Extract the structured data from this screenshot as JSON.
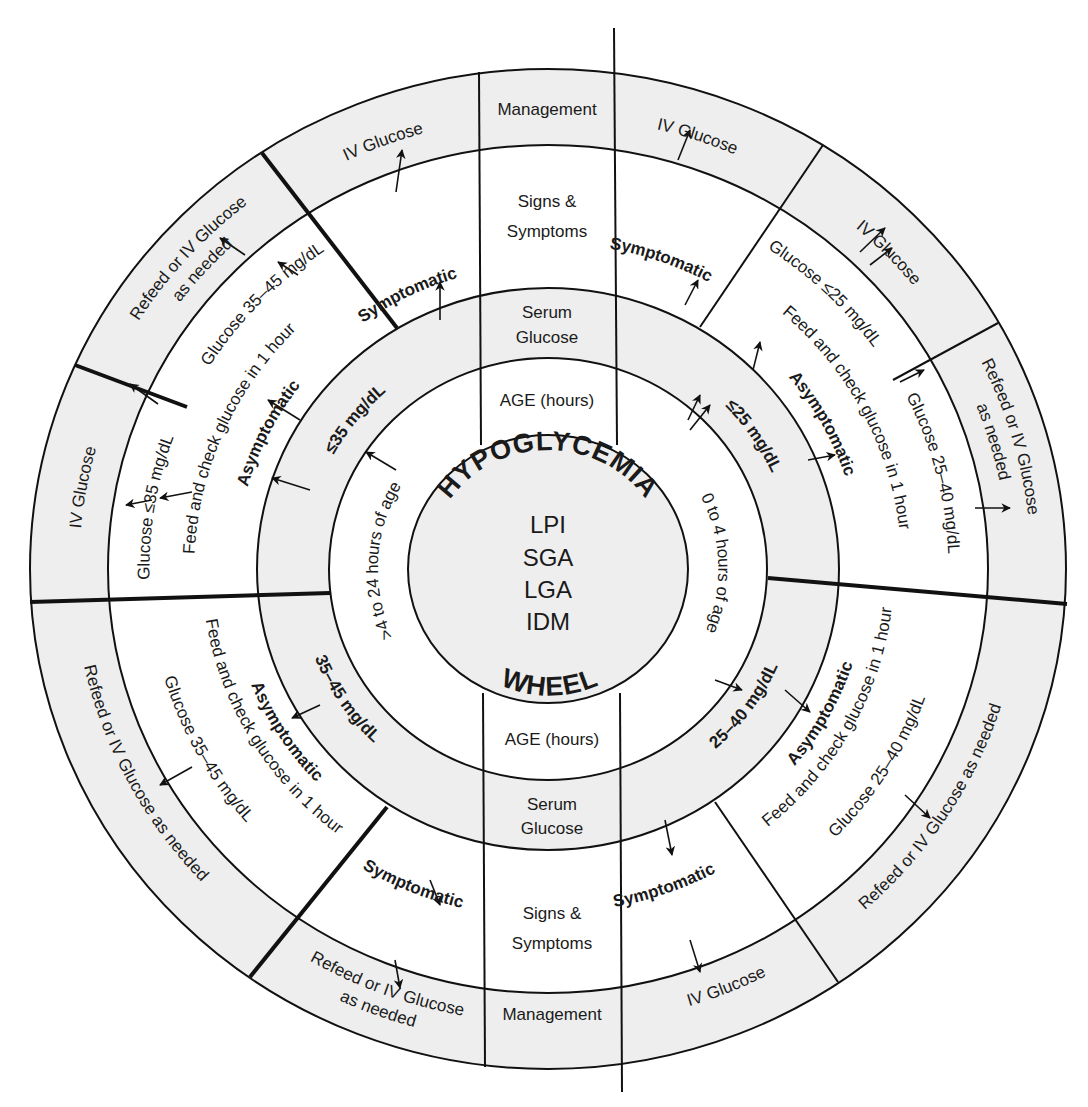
{
  "center": {
    "title_top": "HYPOGLYCEMIA",
    "title_bottom": "WHEEL",
    "conditions": [
      "LPI",
      "SGA",
      "LGA",
      "IDM"
    ]
  },
  "axis_labels": {
    "top": {
      "age": "AGE (hours)",
      "serum": [
        "Serum",
        "Glucose"
      ],
      "signs": [
        "Signs &",
        "Symptoms"
      ],
      "management": "Management"
    },
    "bottom": {
      "age": "AGE (hours)",
      "serum": [
        "Serum",
        "Glucose"
      ],
      "signs": [
        "Signs &",
        "Symptoms"
      ],
      "management": "Management"
    }
  },
  "colors": {
    "band_fill": "#eeeeee",
    "line": "#111111",
    "leq_symbol": "#8a8a8a"
  },
  "arc_labels": [
    {
      "id": "age-0-4",
      "text": "0 to 4 hours of age",
      "r": 168,
      "a": 88,
      "dir": "cw",
      "cls": "n"
    },
    {
      "id": "age-4-24",
      "text": ">4 to 24 hours of age",
      "r": 168,
      "a": 273,
      "dir": "cw",
      "cls": "n"
    },
    {
      "id": "serum-le25",
      "text": "≤25 mg/dL",
      "r": 240,
      "a": 57,
      "dir": "cw",
      "cls": "b"
    },
    {
      "id": "serum-25-40",
      "text": "25–40 mg/dL",
      "r": 238,
      "a": 125,
      "dir": "ccw",
      "cls": "b"
    },
    {
      "id": "serum-le35",
      "text": "≤35 mg/dL",
      "r": 240,
      "a": 308,
      "dir": "cw",
      "cls": "b"
    },
    {
      "id": "serum-35-45",
      "text": "35–45 mg/dL",
      "r": 238,
      "a": 237,
      "dir": "ccw",
      "cls": "b"
    },
    {
      "id": "sym-top-left",
      "text": "Symptomatic",
      "r": 308,
      "a": 333,
      "dir": "cw",
      "cls": "b"
    },
    {
      "id": "sym-top-right",
      "text": "Symptomatic",
      "r": 330,
      "a": 20,
      "dir": "cw",
      "cls": "b"
    },
    {
      "id": "asym-right-top",
      "text": "Asymptomatic",
      "r": 305,
      "a": 62,
      "dir": "cw",
      "cls": "b"
    },
    {
      "id": "asym-right-bottom",
      "text": "Asymptomatic",
      "r": 305,
      "a": 118,
      "dir": "ccw",
      "cls": "b"
    },
    {
      "id": "sym-bottom-right",
      "text": "Symptomatic",
      "r": 340,
      "a": 160,
      "dir": "ccw",
      "cls": "b"
    },
    {
      "id": "sym-bottom-left",
      "text": "Symptomatic",
      "r": 345,
      "a": 203,
      "dir": "ccw",
      "cls": "b"
    },
    {
      "id": "asym-bottom-left",
      "text": "Asymptomatic",
      "r": 305,
      "a": 238,
      "dir": "ccw",
      "cls": "b"
    },
    {
      "id": "asym-left",
      "text": "Asymptomatic",
      "r": 305,
      "a": 296,
      "dir": "cw",
      "cls": "b"
    },
    {
      "id": "feed-left",
      "text": "Feed and check glucose in 1 hour",
      "r": 345,
      "a": 293,
      "dir": "cw",
      "cls": "n"
    },
    {
      "id": "glucose-le35",
      "text": "Glucose ≤35 mg/dL",
      "r": 388,
      "a": 279,
      "dir": "cw",
      "cls": "n"
    },
    {
      "id": "glucose-35-45-top",
      "text": "Glucose 35–45 mg/dL",
      "r": 388,
      "a": 313,
      "dir": "cw",
      "cls": "n"
    },
    {
      "id": "glucose-le25",
      "text": "Glucose ≤25 mg/dL",
      "r": 388,
      "a": 45,
      "dir": "cw",
      "cls": "n"
    },
    {
      "id": "feed-right-top",
      "text": "Feed and check glucose in 1 hour",
      "r": 345,
      "a": 63,
      "dir": "cw",
      "cls": "n"
    },
    {
      "id": "glucose-25-40-right",
      "text": "Glucose 25–40 mg/dL",
      "r": 390,
      "a": 76,
      "dir": "cw",
      "cls": "n"
    },
    {
      "id": "feed-right-bottom",
      "text": "Feed and check glucose in 1 hour",
      "r": 330,
      "a": 118,
      "dir": "ccw",
      "cls": "n"
    },
    {
      "id": "glucose-25-40-bottom",
      "text": "Glucose 25–40 mg/dL",
      "r": 382,
      "a": 121,
      "dir": "ccw",
      "cls": "n"
    },
    {
      "id": "feed-left-bottom",
      "text": "Feed and check glucose in 1 hour",
      "r": 330,
      "a": 240,
      "dir": "ccw",
      "cls": "n"
    },
    {
      "id": "glucose-35-45-bottom",
      "text": "Glucose 35–45 mg/dL",
      "r": 382,
      "a": 242,
      "dir": "ccw",
      "cls": "n"
    },
    {
      "id": "iv-top-left",
      "text": "IV Glucose",
      "r": 456,
      "a": 339,
      "dir": "cw",
      "cls": "n"
    },
    {
      "id": "iv-top-right",
      "text": "IV Glucose",
      "r": 456,
      "a": 19,
      "dir": "cw",
      "cls": "n"
    },
    {
      "id": "iv-right-upper",
      "text": "IV Glucose",
      "r": 456,
      "a": 47,
      "dir": "cw",
      "cls": "n"
    },
    {
      "id": "refeed-right-1",
      "text": "Refeed or IV Glucose",
      "r": 470,
      "a": 74,
      "dir": "cw",
      "cls": "n"
    },
    {
      "id": "refeed-right-2",
      "text": "as needed",
      "r": 448,
      "a": 74,
      "dir": "cw",
      "cls": "n"
    },
    {
      "id": "refeed-bottom-right",
      "text": "Refeed or IV Glucose as needed",
      "r": 454,
      "a": 122,
      "dir": "ccw",
      "cls": "n"
    },
    {
      "id": "iv-bottom-right",
      "text": "IV Glucose",
      "r": 454,
      "a": 157,
      "dir": "ccw",
      "cls": "n"
    },
    {
      "id": "refeed-bottom-1",
      "text": "Refeed or IV Glucose",
      "r": 450,
      "a": 201,
      "dir": "ccw",
      "cls": "n"
    },
    {
      "id": "refeed-bottom-2",
      "text": "as needed",
      "r": 472,
      "a": 201,
      "dir": "ccw",
      "cls": "n"
    },
    {
      "id": "refeed-bottom-left",
      "text": "Refeed or IV Glucose as needed",
      "r": 454,
      "a": 243,
      "dir": "ccw",
      "cls": "n"
    },
    {
      "id": "iv-left",
      "text": "IV Glucose",
      "r": 456,
      "a": 280,
      "dir": "cw",
      "cls": "n"
    },
    {
      "id": "refeed-top-left-1",
      "text": "Refeed or IV Glucose",
      "r": 470,
      "a": 311,
      "dir": "cw",
      "cls": "n"
    },
    {
      "id": "refeed-top-left-2",
      "text": "as needed",
      "r": 448,
      "a": 311,
      "dir": "cw",
      "cls": "n"
    }
  ],
  "arrows": [
    [
      440,
      320,
      440,
      282
    ],
    [
      396,
      192,
      402,
      150
    ],
    [
      300,
      420,
      268,
      400
    ],
    [
      310,
      490,
      272,
      478
    ],
    [
      396,
      470,
      366,
      452
    ],
    [
      152,
      500,
      126,
      505
    ],
    [
      192,
      492,
      160,
      498
    ],
    [
      245,
      255,
      220,
      238
    ],
    [
      298,
      275,
      278,
      262
    ],
    [
      158,
      404,
      130,
      384
    ],
    [
      430,
      880,
      440,
      905
    ],
    [
      395,
      960,
      400,
      988
    ],
    [
      320,
      705,
      292,
      718
    ],
    [
      192,
      767,
      160,
      785
    ],
    [
      685,
      305,
      698,
      280
    ],
    [
      688,
      420,
      700,
      395
    ],
    [
      753,
      370,
      760,
      342
    ],
    [
      690,
      430,
      710,
      405
    ],
    [
      678,
      160,
      690,
      130
    ],
    [
      860,
      252,
      885,
      228
    ],
    [
      870,
      265,
      892,
      248
    ],
    [
      808,
      460,
      835,
      455
    ],
    [
      900,
      382,
      924,
      370
    ],
    [
      975,
      508,
      1010,
      508
    ],
    [
      715,
      680,
      742,
      690
    ],
    [
      785,
      690,
      810,
      712
    ],
    [
      905,
      795,
      930,
      818
    ],
    [
      665,
      820,
      672,
      855
    ],
    [
      690,
      940,
      700,
      972
    ]
  ],
  "dividers": [
    {
      "x1": 30,
      "y1": 602,
      "x2": 330,
      "y2": 593,
      "w": 4
    },
    {
      "x1": 768,
      "y1": 578,
      "x2": 1067,
      "y2": 604,
      "w": 4
    },
    {
      "x1": 397,
      "y1": 328,
      "x2": 262,
      "y2": 153,
      "w": 4
    },
    {
      "x1": 187,
      "y1": 407,
      "x2": 75,
      "y2": 365,
      "w": 4
    },
    {
      "x1": 387,
      "y1": 807,
      "x2": 250,
      "y2": 977,
      "w": 4
    },
    {
      "x1": 700,
      "y1": 327,
      "x2": 823,
      "y2": 145,
      "w": 2
    },
    {
      "x1": 893,
      "y1": 380,
      "x2": 998,
      "y2": 323,
      "w": 2
    },
    {
      "x1": 715,
      "y1": 802,
      "x2": 838,
      "y2": 982,
      "w": 2
    }
  ]
}
